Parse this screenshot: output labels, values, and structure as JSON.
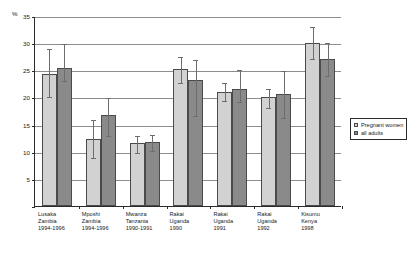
{
  "chart_data": {
    "type": "bar",
    "title": "",
    "xlabel": "",
    "ylabel": "%",
    "ylim": [
      0,
      35
    ],
    "yticks": [
      0,
      5,
      10,
      15,
      20,
      25,
      30,
      35
    ],
    "ytick_labels": [
      "",
      "5",
      "10",
      "15",
      "20",
      "25",
      "30",
      "35"
    ],
    "grid": true,
    "legend_position": "right",
    "error_bars": true,
    "categories": [
      "Lusaka\nZambia\n1994-1996",
      "Mposhi\nZambia\n1994-1996",
      "Mwanza\nTanzania\n1990-1991",
      "Rakai\nUganda\n1990",
      "Rakai\nUganda\n1991",
      "Rakai\nUganda\n1992",
      "Kisumu\nKenya\n1998"
    ],
    "category_lines": [
      [
        "Lusaka",
        "Zambia",
        "1994-1996"
      ],
      [
        "Mposhi",
        "Zambia",
        "1994-1996"
      ],
      [
        "Mwanza",
        "Tanzania",
        "1990-1991"
      ],
      [
        "Rakai",
        "Uganda",
        "1990"
      ],
      [
        "Rakai",
        "Uganda",
        "1991"
      ],
      [
        "Rakai",
        "Uganda",
        "1992"
      ],
      [
        "Kisumu",
        "Kenya",
        "1998"
      ]
    ],
    "series": [
      {
        "name": "Pregnant women",
        "color": "#d2d2d2",
        "values": [
          24.3,
          12.4,
          11.6,
          25.3,
          21.0,
          20.0,
          30.0
        ],
        "err_low": [
          20.3,
          9.0,
          10.0,
          22.8,
          19.6,
          18.3,
          27.3
        ],
        "err_high": [
          29.1,
          16.1,
          13.0,
          27.6,
          22.8,
          21.8,
          33.2
        ]
      },
      {
        "name": "all adults",
        "color": "#8a8a8a",
        "values": [
          25.4,
          16.8,
          11.8,
          23.2,
          21.6,
          20.7,
          27.0
        ],
        "err_low": [
          23.3,
          13.0,
          10.3,
          16.8,
          19.4,
          16.4,
          24.2
        ],
        "err_high": [
          30.0,
          20.0,
          13.2,
          27.0,
          25.2,
          25.0,
          30.2
        ]
      }
    ]
  },
  "legend": {
    "items": [
      {
        "label": "Pregnant women",
        "swatch": "s0"
      },
      {
        "label": "all adults",
        "swatch": "s1"
      }
    ]
  },
  "axis": {
    "percent_symbol": "%"
  }
}
